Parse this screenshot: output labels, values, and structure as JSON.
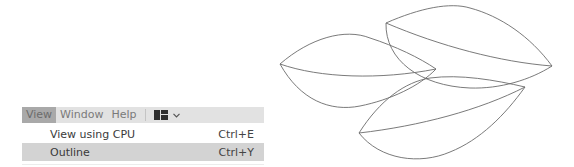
{
  "menubar": {
    "items": [
      {
        "label": "View",
        "active": true
      },
      {
        "label": "Window",
        "active": false
      },
      {
        "label": "Help",
        "active": false
      }
    ],
    "layout_icon": "workspace-layout-icon",
    "layout_chevron": "chevron-down-icon"
  },
  "dropdown": {
    "items": [
      {
        "label": "View using CPU",
        "shortcut": "Ctrl+E",
        "highlighted": false
      },
      {
        "label": "Outline",
        "shortcut": "Ctrl+Y",
        "highlighted": true
      }
    ]
  },
  "canvas": {
    "mode": "outline",
    "stroke_color": "#555555",
    "shapes": [
      {
        "name": "leaf-left",
        "tip_a": [
          280,
          64
        ],
        "tip_b": [
          436,
          69
        ]
      },
      {
        "name": "leaf-top-right",
        "tip_a": [
          386,
          23
        ],
        "tip_b": [
          552,
          66
        ]
      },
      {
        "name": "leaf-bottom",
        "tip_a": [
          359,
          133
        ],
        "tip_b": [
          525,
          87
        ]
      }
    ]
  },
  "colors": {
    "menubar_bg": "#e2e2e2",
    "menu_active_bg": "#a9a9a9",
    "item_highlight_bg": "#d3d3d3"
  }
}
